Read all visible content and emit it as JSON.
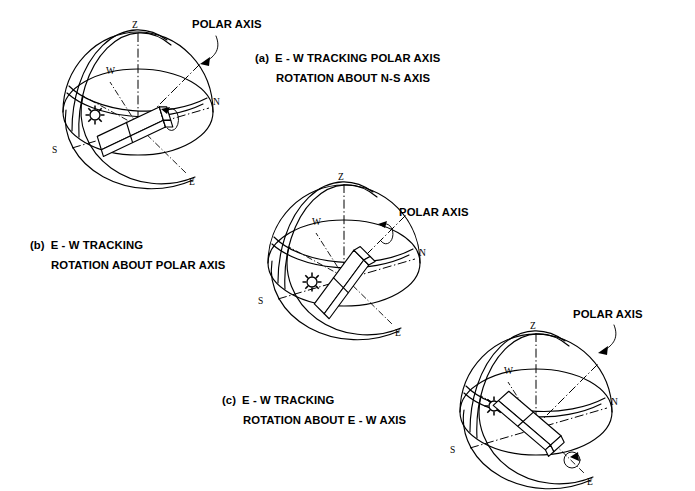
{
  "figure": {
    "background_color": "#ffffff",
    "line_color": "#000000",
    "title": ""
  },
  "panels": [
    {
      "id": "a",
      "marker": "(a)",
      "caption_line1": "E - W TRACKING   POLAR AXIS",
      "caption_line2": "ROTATION ABOUT N-S AXIS",
      "polar_axis_label": "POLAR AXIS",
      "has_polar_axis_arrow": true,
      "cardinals": {
        "zenith": "Z",
        "north": "N",
        "south": "S",
        "east": "E",
        "west": "W"
      },
      "sun_symbol": "sun",
      "collector": "tracking-collector-box",
      "rotation_arrow": "rotation-arrow"
    },
    {
      "id": "b",
      "marker": "(b)",
      "caption_line1": "E - W TRACKING",
      "caption_line2": "ROTATION ABOUT POLAR AXIS",
      "polar_axis_label": "POLAR AXIS",
      "has_polar_axis_arrow": false,
      "cardinals": {
        "zenith": "Z",
        "north": "N",
        "south": "S",
        "east": "E",
        "west": "W"
      },
      "sun_symbol": "sun",
      "collector": "tracking-collector-box",
      "rotation_arrow": "rotation-arrow"
    },
    {
      "id": "c",
      "marker": "(c)",
      "caption_line1": "E - W TRACKING",
      "caption_line2": "ROTATION ABOUT E - W AXIS",
      "polar_axis_label": "POLAR AXIS",
      "has_polar_axis_arrow": true,
      "cardinals": {
        "zenith": "Z",
        "north": "N",
        "south": "S",
        "east": "E",
        "west": "W"
      },
      "sun_symbol": "sun",
      "collector": "tracking-collector-box",
      "rotation_arrow": "rotation-arrow"
    }
  ]
}
